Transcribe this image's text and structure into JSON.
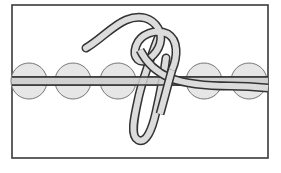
{
  "diagram": {
    "kind": "knot-illustration",
    "colors": {
      "background": "#ffffff",
      "frame": "#3a3a3a",
      "outline": "#333333",
      "rope_fill": "#dcdcdc",
      "bead_fill": "#e6e6e6",
      "bead_stroke": "#777777",
      "cord_fill": "#cfcfcf"
    },
    "frame": {
      "x": 12,
      "y": 5,
      "width": 256,
      "height": 153
    },
    "cord": {
      "y_top": 77,
      "y_bottom": 85,
      "x_start": 12,
      "x_end": 268
    },
    "beads": [
      {
        "cx": 29,
        "cy": 81,
        "r": 18
      },
      {
        "cx": 73,
        "cy": 81,
        "r": 18
      },
      {
        "cx": 118,
        "cy": 81,
        "r": 18
      },
      {
        "cx": 204,
        "cy": 81,
        "r": 18
      },
      {
        "cx": 249,
        "cy": 81,
        "r": 18
      }
    ],
    "bead_count": 5
  }
}
